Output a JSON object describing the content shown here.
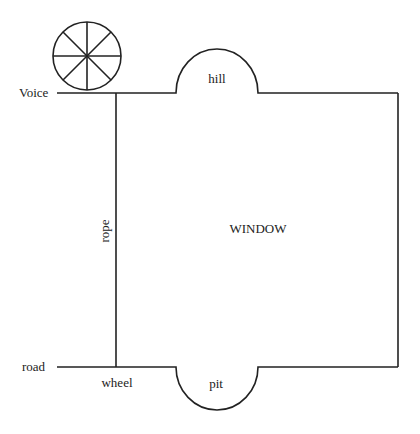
{
  "diagram": {
    "labels": {
      "voice": "Voice",
      "hill": "hill",
      "rope": "rope",
      "window": "WINDOW",
      "road": "road",
      "wheel": "wheel",
      "pit": "pit"
    },
    "icons": {
      "spoked_wheel": "wheel-icon"
    },
    "colors": {
      "stroke": "#222222",
      "background": "#ffffff"
    }
  }
}
